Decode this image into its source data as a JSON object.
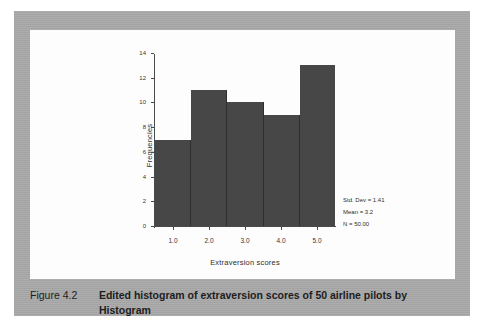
{
  "colors": {
    "page_background": "#a9a9a9",
    "panel_background": "#fdfdfd",
    "bar_fill": "#474747",
    "bar_edge": "#2f2f2f",
    "axis": "#4a4a4a",
    "text": "#2d2d2d",
    "caption_text": "#1d1d1d"
  },
  "caption": {
    "label": "Figure 4.2",
    "text": "Edited histogram of extraversion scores of 50 airline pilots by Histogram"
  },
  "chart_data": {
    "type": "bar",
    "title": "",
    "subtitle": "",
    "xlabel": "Extraversion scores",
    "ylabel": "Frequencies",
    "categories": [
      "1.0",
      "2.0",
      "3.0",
      "4.0",
      "5.0"
    ],
    "x": [
      1.0,
      2.0,
      3.0,
      4.0,
      5.0
    ],
    "values": [
      7,
      11,
      10,
      9,
      13
    ],
    "bin_edges": [
      0.5,
      1.5,
      2.5,
      3.5,
      4.5,
      5.5
    ],
    "xlim": [
      0.5,
      5.5
    ],
    "ylim": [
      0,
      14
    ],
    "x_tick_labels": [
      "1.0",
      "2.0",
      "3.0",
      "4.0",
      "5.0"
    ],
    "y_tick_labels": [
      "0",
      "2",
      "4",
      "6",
      "8",
      "10",
      "12",
      "14"
    ],
    "y_ticks": [
      0,
      2,
      4,
      6,
      8,
      10,
      12,
      14
    ],
    "grid": false,
    "legend": false,
    "legend_position": "none",
    "annotations": [
      "Std. Dev = 1.41",
      "Mean = 3.2",
      "N = 50.00"
    ],
    "stats": {
      "std_dev": "Std. Dev = 1.41",
      "mean": "Mean = 3.2",
      "n": "N = 50.00"
    }
  }
}
